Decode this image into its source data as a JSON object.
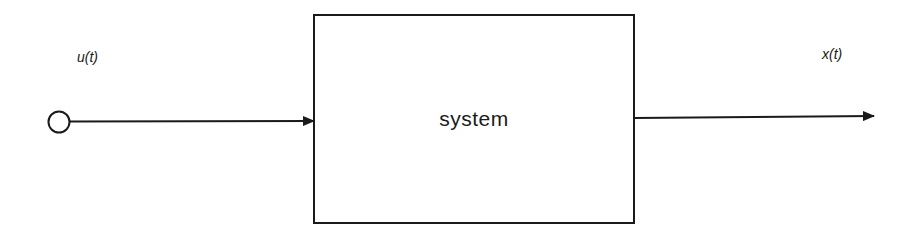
{
  "diagram": {
    "type": "block-diagram",
    "colors": {
      "stroke": "#1a1a1a",
      "background": "#ffffff"
    },
    "input": {
      "label": "u(t)",
      "node": "source-circle"
    },
    "block": {
      "label": "system"
    },
    "output": {
      "label": "x(t)"
    },
    "connections": [
      {
        "from": "input-node",
        "to": "system-block",
        "style": "arrow"
      },
      {
        "from": "system-block",
        "to": "output",
        "style": "arrow"
      }
    ]
  }
}
